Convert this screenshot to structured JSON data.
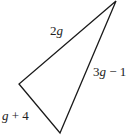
{
  "figure": {
    "type": "triangle",
    "sides": [
      {
        "id": "side-top-left",
        "label_var": "2g",
        "label_coef": "2",
        "label_sym": "g",
        "label_rest": ""
      },
      {
        "id": "side-right",
        "label_coef": "3",
        "label_sym": "g",
        "label_rest": " − 1"
      },
      {
        "id": "side-bottom-left",
        "label_coef": "",
        "label_sym": "g",
        "label_rest": " + 4"
      }
    ],
    "stroke_color": "#1a1a1a",
    "label_color": "#222222"
  }
}
